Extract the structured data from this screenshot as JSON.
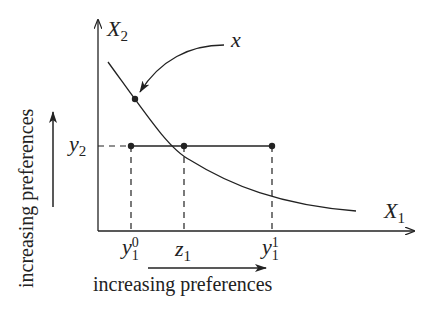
{
  "diagram": {
    "axes": {
      "x_label": "X",
      "x_label_sub": "1",
      "y_label": "X",
      "y_label_sub": "2"
    },
    "point_label": "x",
    "y_tick": {
      "base": "y",
      "sub": "2"
    },
    "x_ticks": [
      {
        "base": "y",
        "sub": "1",
        "sup": "0"
      },
      {
        "base": "z",
        "sub": "1",
        "sup": ""
      },
      {
        "base": "y",
        "sub": "1",
        "sup": "1"
      }
    ],
    "captions": {
      "horizontal": "increasing preferences",
      "vertical": "increasing preferences"
    },
    "colors": {
      "ink": "#222222",
      "background": "#ffffff"
    }
  }
}
